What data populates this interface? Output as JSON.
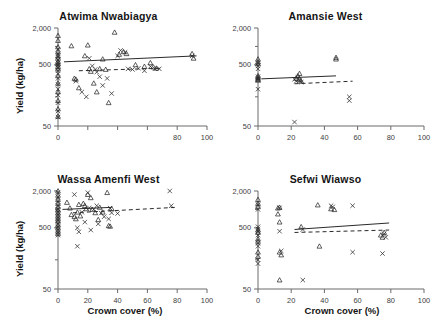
{
  "figure": {
    "layout": "2x2 panel grid",
    "shared_ylabel": "Yield (kg/ha)",
    "shared_xlabel": "Crown cover (%)"
  },
  "axis_labels": {
    "y": "Yield (kg/ha)",
    "x": "Crown cover (%)",
    "y_ticks": [
      "2,000",
      "500",
      "50"
    ],
    "x_ticks": [
      "0",
      "20",
      "40",
      "60",
      "80",
      "100"
    ]
  },
  "chart_data": [
    {
      "type": "scatter",
      "title": "Atwima Nwabiagya",
      "panel": "top-left",
      "xlabel": "Crown cover (%)",
      "ylabel": "Yield (kg/ha)",
      "xlim": [
        0,
        100
      ],
      "ylim": [
        50,
        2000
      ],
      "yscale": "log",
      "grid": false,
      "legend": "none",
      "xticks": [
        0,
        20,
        40,
        60,
        80,
        100
      ],
      "xticklabels": [
        "0",
        "",
        "",
        "",
        "80",
        "100"
      ],
      "yticks": [
        50,
        500,
        2000
      ],
      "yticklabels": [
        "50",
        "500",
        "2,000"
      ],
      "series": [
        {
          "name": "triangle",
          "marker": "triangle",
          "points": [
            [
              0,
              1500
            ],
            [
              0,
              1250
            ],
            [
              0,
              980
            ],
            [
              0,
              820
            ],
            [
              0,
              700
            ],
            [
              0,
              640
            ],
            [
              0,
              560
            ],
            [
              0,
              520
            ],
            [
              0,
              470
            ],
            [
              0,
              430
            ],
            [
              0,
              330
            ],
            [
              0,
              250
            ],
            [
              0,
              180
            ],
            [
              0,
              130
            ],
            [
              0,
              95
            ],
            [
              0,
              72
            ],
            [
              9,
              1020
            ],
            [
              11,
              300
            ],
            [
              12,
              290
            ],
            [
              14,
              210
            ],
            [
              18,
              700
            ],
            [
              20,
              1050
            ],
            [
              21,
              430
            ],
            [
              22,
              390
            ],
            [
              24,
              250
            ],
            [
              26,
              180
            ],
            [
              28,
              430
            ],
            [
              30,
              620
            ],
            [
              32,
              420
            ],
            [
              34,
              120
            ],
            [
              38,
              1700
            ],
            [
              41,
              740
            ],
            [
              44,
              820
            ],
            [
              46,
              760
            ],
            [
              52,
              500
            ],
            [
              58,
              470
            ],
            [
              62,
              540
            ],
            [
              64,
              460
            ],
            [
              66,
              440
            ],
            [
              90,
              760
            ],
            [
              91,
              640
            ]
          ]
        },
        {
          "name": "cross",
          "marker": "cross",
          "points": [
            [
              0,
              900
            ],
            [
              0,
              760
            ],
            [
              0,
              690
            ],
            [
              0,
              600
            ],
            [
              0,
              540
            ],
            [
              0,
              500
            ],
            [
              0,
              450
            ],
            [
              0,
              400
            ],
            [
              0,
              360
            ],
            [
              0,
              300
            ],
            [
              0,
              240
            ],
            [
              0,
              200
            ],
            [
              0,
              160
            ],
            [
              0,
              120
            ],
            [
              0,
              88
            ],
            [
              0,
              70
            ],
            [
              12,
              270
            ],
            [
              16,
              180
            ],
            [
              19,
              150
            ],
            [
              21,
              640
            ],
            [
              23,
              480
            ],
            [
              25,
              420
            ],
            [
              26,
              380
            ],
            [
              28,
              320
            ],
            [
              30,
              230
            ],
            [
              33,
              300
            ],
            [
              36,
              170
            ],
            [
              40,
              700
            ],
            [
              42,
              860
            ],
            [
              45,
              800
            ],
            [
              47,
              430
            ],
            [
              50,
              420
            ],
            [
              54,
              440
            ],
            [
              58,
              400
            ],
            [
              62,
              470
            ],
            [
              65,
              430
            ],
            [
              68,
              430
            ],
            [
              90,
              700
            ]
          ]
        }
      ],
      "fits": [
        {
          "style": "solid",
          "x0": 4,
          "y0": 560,
          "x1": 93,
          "y1": 700
        },
        {
          "style": "dashed",
          "x0": 14,
          "y0": 400,
          "x1": 70,
          "y1": 440
        }
      ]
    },
    {
      "type": "scatter",
      "title": "Amansie West",
      "panel": "top-right",
      "xlabel": "Crown cover (%)",
      "ylabel": "Yield (kg/ha)",
      "xlim": [
        0,
        100
      ],
      "ylim": [
        50,
        2000
      ],
      "yscale": "log",
      "grid": false,
      "legend": "none",
      "xticks": [
        0,
        20,
        40,
        60,
        80,
        100
      ],
      "xticklabels": [
        "0",
        "20",
        "40",
        "60",
        "80",
        "100"
      ],
      "yticks": [
        50,
        500,
        2000
      ],
      "yticklabels": [
        "50",
        "500",
        "2,000"
      ],
      "series": [
        {
          "name": "triangle",
          "marker": "triangle",
          "points": [
            [
              0,
              620
            ],
            [
              0,
              560
            ],
            [
              0,
              520
            ],
            [
              0,
              330
            ],
            [
              0,
              310
            ],
            [
              0,
              290
            ],
            [
              0,
              280
            ],
            [
              23,
              300
            ],
            [
              24,
              330
            ],
            [
              25,
              360
            ],
            [
              25,
              290
            ],
            [
              26,
              270
            ],
            [
              47,
              660
            ],
            [
              47,
              620
            ]
          ]
        },
        {
          "name": "cross",
          "marker": "cross",
          "points": [
            [
              0,
              530
            ],
            [
              0,
              480
            ],
            [
              0,
              430
            ],
            [
              0,
              320
            ],
            [
              0,
              300
            ],
            [
              0,
              280
            ],
            [
              0,
              200
            ],
            [
              22,
              290
            ],
            [
              23,
              270
            ],
            [
              24,
              310
            ],
            [
              25,
              280
            ],
            [
              26,
              260
            ],
            [
              22,
              58
            ],
            [
              55,
              150
            ],
            [
              55,
              130
            ]
          ]
        }
      ],
      "fits": [
        {
          "style": "solid",
          "x0": 2,
          "y0": 295,
          "x1": 47,
          "y1": 330
        },
        {
          "style": "dashed",
          "x0": 22,
          "y0": 245,
          "x1": 57,
          "y1": 270
        }
      ]
    },
    {
      "type": "scatter",
      "title": "Wassa Amenfi West",
      "panel": "bottom-left",
      "xlabel": "Crown cover (%)",
      "ylabel": "Yield (kg/ha)",
      "xlim": [
        0,
        100
      ],
      "ylim": [
        50,
        2000
      ],
      "yscale": "log",
      "grid": false,
      "legend": "none",
      "xticks": [
        0,
        20,
        40,
        60,
        80,
        100
      ],
      "xticklabels": [
        "0",
        "20",
        "40",
        "60",
        "80",
        "100"
      ],
      "yticks": [
        50,
        500,
        2000
      ],
      "yticklabels": [
        "50",
        "500",
        "2,000"
      ],
      "series": [
        {
          "name": "triangle",
          "marker": "triangle",
          "points": [
            [
              0,
              2000
            ],
            [
              0,
              1700
            ],
            [
              0,
              1450
            ],
            [
              0,
              1250
            ],
            [
              0,
              1100
            ],
            [
              0,
              980
            ],
            [
              0,
              880
            ],
            [
              0,
              780
            ],
            [
              0,
              700
            ],
            [
              0,
              640
            ],
            [
              0,
              560
            ],
            [
              0,
              500
            ],
            [
              0,
              440
            ],
            [
              0,
              400
            ],
            [
              6,
              1300
            ],
            [
              8,
              1050
            ],
            [
              9,
              820
            ],
            [
              11,
              760
            ],
            [
              12,
              700
            ],
            [
              13,
              900
            ],
            [
              14,
              1200
            ],
            [
              15,
              780
            ],
            [
              17,
              1250
            ],
            [
              18,
              1150
            ],
            [
              19,
              1020
            ],
            [
              20,
              1750
            ],
            [
              22,
              1550
            ],
            [
              23,
              1000
            ],
            [
              25,
              880
            ],
            [
              27,
              680
            ],
            [
              28,
              1080
            ],
            [
              30,
              900
            ],
            [
              33,
              1880
            ],
            [
              34,
              540
            ],
            [
              35,
              530
            ],
            [
              36,
              1030
            ]
          ]
        },
        {
          "name": "cross",
          "marker": "cross",
          "points": [
            [
              0,
              1900
            ],
            [
              0,
              1600
            ],
            [
              0,
              1350
            ],
            [
              0,
              1150
            ],
            [
              0,
              1000
            ],
            [
              0,
              900
            ],
            [
              0,
              820
            ],
            [
              0,
              740
            ],
            [
              0,
              660
            ],
            [
              0,
              580
            ],
            [
              0,
              520
            ],
            [
              0,
              470
            ],
            [
              0,
              420
            ],
            [
              0,
              380
            ],
            [
              11,
              1750
            ],
            [
              13,
              500
            ],
            [
              13,
              250
            ],
            [
              14,
              430
            ],
            [
              16,
              900
            ],
            [
              18,
              620
            ],
            [
              20,
              1880
            ],
            [
              21,
              1060
            ],
            [
              22,
              460
            ],
            [
              24,
              1000
            ],
            [
              26,
              1150
            ],
            [
              27,
              580
            ],
            [
              29,
              870
            ],
            [
              31,
              760
            ],
            [
              34,
              700
            ],
            [
              35,
              1050
            ],
            [
              36,
              880
            ],
            [
              40,
              860
            ],
            [
              75,
              2000
            ],
            [
              76,
              1150
            ]
          ]
        }
      ],
      "fits": [
        {
          "style": "solid",
          "x0": 3,
          "y0": 1000,
          "x1": 36,
          "y1": 1080
        },
        {
          "style": "dashed",
          "x0": 10,
          "y0": 880,
          "x1": 79,
          "y1": 1080
        }
      ]
    },
    {
      "type": "scatter",
      "title": "Sefwi Wiawso",
      "panel": "bottom-right",
      "xlabel": "Crown cover (%)",
      "ylabel": "Yield (kg/ha)",
      "xlim": [
        0,
        100
      ],
      "ylim": [
        50,
        2000
      ],
      "yscale": "log",
      "grid": false,
      "legend": "none",
      "xticks": [
        0,
        20,
        40,
        60,
        80,
        100
      ],
      "xticklabels": [
        "0",
        "20",
        "40",
        "60",
        "80",
        "100"
      ],
      "yticks": [
        50,
        500,
        2000
      ],
      "yticklabels": [
        "50",
        "500",
        "2,000"
      ],
      "series": [
        {
          "name": "triangle",
          "marker": "triangle",
          "points": [
            [
              0,
              1450
            ],
            [
              0,
              1250
            ],
            [
              0,
              1100
            ],
            [
              0,
              460
            ],
            [
              0,
              420
            ],
            [
              0,
              330
            ],
            [
              0,
              300
            ],
            [
              0,
              200
            ],
            [
              0,
              170
            ],
            [
              12,
              1050
            ],
            [
              12,
              840
            ],
            [
              13,
              1080
            ],
            [
              13,
              620
            ],
            [
              13,
              200
            ],
            [
              14,
              180
            ],
            [
              13,
              70
            ],
            [
              26,
              520
            ],
            [
              36,
              1180
            ],
            [
              44,
              1020
            ],
            [
              46,
              990
            ],
            [
              37,
              250
            ],
            [
              74,
              380
            ],
            [
              75,
              350
            ],
            [
              76,
              420
            ]
          ]
        },
        {
          "name": "cross",
          "marker": "cross",
          "points": [
            [
              0,
              1200
            ],
            [
              0,
              1000
            ],
            [
              0,
              520
            ],
            [
              0,
              480
            ],
            [
              0,
              440
            ],
            [
              0,
              380
            ],
            [
              0,
              280
            ],
            [
              0,
              250
            ],
            [
              0,
              150
            ],
            [
              0,
              130
            ],
            [
              13,
              1060
            ],
            [
              13,
              440
            ],
            [
              14,
              210
            ],
            [
              27,
              470
            ],
            [
              27,
              70
            ],
            [
              44,
              1150
            ],
            [
              45,
              1100
            ],
            [
              57,
              1150
            ],
            [
              57,
              200
            ],
            [
              75,
              190
            ],
            [
              76,
              400
            ],
            [
              77,
              350
            ]
          ]
        }
      ],
      "fits": [
        {
          "style": "solid",
          "x0": 22,
          "y0": 470,
          "x1": 79,
          "y1": 600
        },
        {
          "style": "dashed",
          "x0": 22,
          "y0": 420,
          "x1": 79,
          "y1": 460
        }
      ]
    }
  ]
}
